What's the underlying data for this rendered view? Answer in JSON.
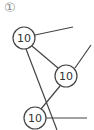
{
  "problem_number": "①",
  "tree": {
    "nodes": [
      {
        "id": "a",
        "label": "10"
      },
      {
        "id": "b",
        "label": "10"
      },
      {
        "id": "c",
        "label": "10"
      }
    ],
    "edges": [
      {
        "from": "a",
        "to": "b"
      },
      {
        "from": "b",
        "to": "c"
      },
      {
        "from": "a",
        "to": "open-right-up"
      },
      {
        "from": "a",
        "to": "open-down"
      },
      {
        "from": "b",
        "to": "open-right-up"
      },
      {
        "from": "c",
        "to": "open-right"
      }
    ]
  },
  "colors": {
    "stroke": "#444444",
    "marker": "#888888"
  }
}
